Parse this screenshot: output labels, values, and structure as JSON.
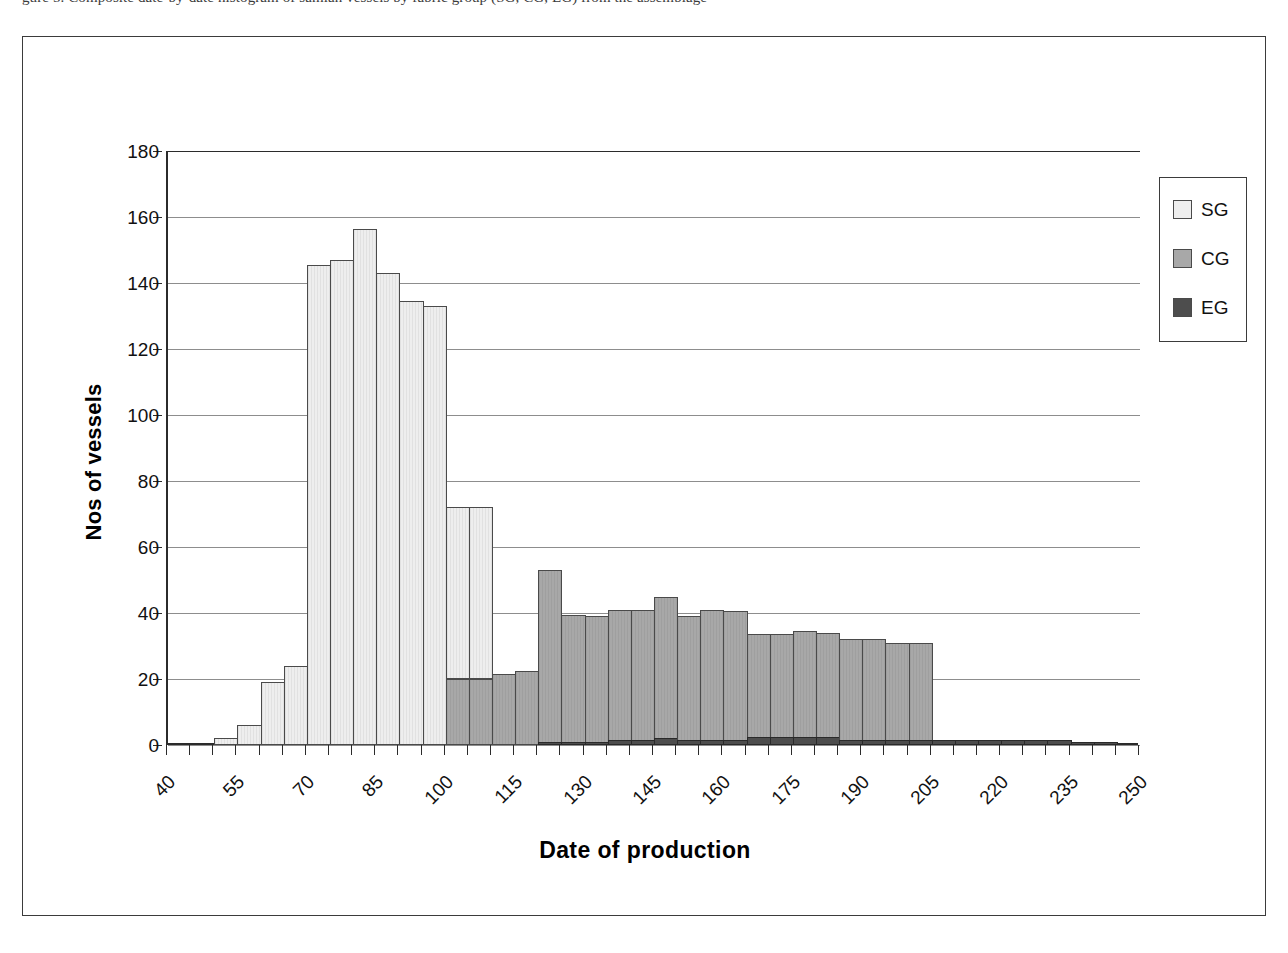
{
  "page": {
    "top_cutoff_text": "gure 5.  Composite date-by-date histogram of samian vessels by fabric group (SG, CG, EG) from the assemblage"
  },
  "chart_data": {
    "type": "bar",
    "title": "",
    "subtitle": "",
    "xlabel": "Date of production",
    "ylabel": "Nos of vessels",
    "ylim": [
      0,
      180
    ],
    "ytick_step": 20,
    "yticks": [
      0,
      20,
      40,
      60,
      80,
      100,
      120,
      140,
      160,
      180
    ],
    "ytick_labels": [
      "0",
      "20",
      "40",
      "60",
      "80",
      "100",
      "120",
      "140",
      "160",
      "180"
    ],
    "xlim": [
      40,
      250
    ],
    "xtick_step": 5,
    "xlabel_step": 15,
    "xtick_labels": [
      "40",
      "55",
      "70",
      "85",
      "100",
      "115",
      "130",
      "145",
      "160",
      "175",
      "190",
      "205",
      "220",
      "235",
      "250"
    ],
    "bin_width": 5,
    "bin_starts": [
      40,
      45,
      50,
      55,
      60,
      65,
      70,
      75,
      80,
      85,
      90,
      95,
      100,
      105,
      110,
      115,
      120,
      125,
      130,
      135,
      140,
      145,
      150,
      155,
      160,
      165,
      170,
      175,
      180,
      185,
      190,
      195,
      200,
      205,
      210,
      215,
      220,
      225,
      230,
      235,
      240,
      245
    ],
    "grid": true,
    "grid_axis": "y",
    "legend_position": "right",
    "stacked": true,
    "series": [
      {
        "name": "SG",
        "color": "#eeeeee",
        "values": [
          0,
          0,
          2,
          6,
          19,
          24,
          145.5,
          147,
          156.5,
          143,
          134.5,
          133,
          72,
          72,
          0,
          0,
          0,
          0,
          0,
          0,
          0,
          0,
          0,
          0,
          0,
          0,
          0,
          0,
          0,
          0,
          0,
          0,
          0,
          0,
          0,
          0,
          0,
          0,
          0,
          0,
          0,
          0
        ]
      },
      {
        "name": "CG",
        "color": "#a8a8a8",
        "values": [
          0,
          0,
          0,
          0,
          0,
          0,
          0,
          0,
          0,
          0,
          0,
          0,
          20,
          20,
          21.5,
          22.5,
          53,
          39.5,
          39,
          41,
          41,
          45,
          39,
          41,
          40.5,
          33.5,
          33.5,
          34.5,
          34,
          32,
          32,
          31,
          31,
          0,
          0,
          0,
          0,
          0,
          0,
          0,
          0,
          0
        ]
      },
      {
        "name": "EG",
        "color": "#4d4d4d",
        "values": [
          0,
          0,
          0,
          0,
          0,
          0,
          0,
          0,
          0,
          0,
          0,
          0,
          0,
          0,
          0,
          0,
          1,
          1,
          1,
          1.5,
          1.5,
          2,
          1.5,
          1.5,
          1.5,
          2.5,
          2.5,
          2.5,
          2.5,
          1.5,
          1.5,
          1.5,
          1.5,
          1.5,
          1.5,
          1.5,
          1.5,
          1.5,
          1.5,
          1,
          1,
          0
        ]
      }
    ]
  },
  "legend": {
    "items": [
      {
        "label": "SG",
        "color": "#eeeeee"
      },
      {
        "label": "CG",
        "color": "#a8a8a8"
      },
      {
        "label": "EG",
        "color": "#4d4d4d"
      }
    ]
  }
}
